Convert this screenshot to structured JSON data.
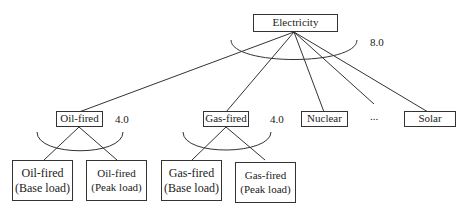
{
  "root": {
    "label": "Electricity",
    "elasticity": "8.0"
  },
  "level1": [
    {
      "label": "Oil-fired",
      "elasticity": "4.0"
    },
    {
      "label": "Gas-fired",
      "elasticity": "4.0"
    },
    {
      "label": "Nuclear"
    },
    {
      "label": "..."
    },
    {
      "label": "Solar"
    }
  ],
  "leaves": [
    {
      "line1": "Oil-fired",
      "line2": "(Base load)"
    },
    {
      "line1": "Oil-fired",
      "line2": "(Peak load)"
    },
    {
      "line1": "Gas-fired",
      "line2": "(Base load)"
    },
    {
      "line1": "Gas-fired",
      "line2": "(Peak load)"
    }
  ]
}
